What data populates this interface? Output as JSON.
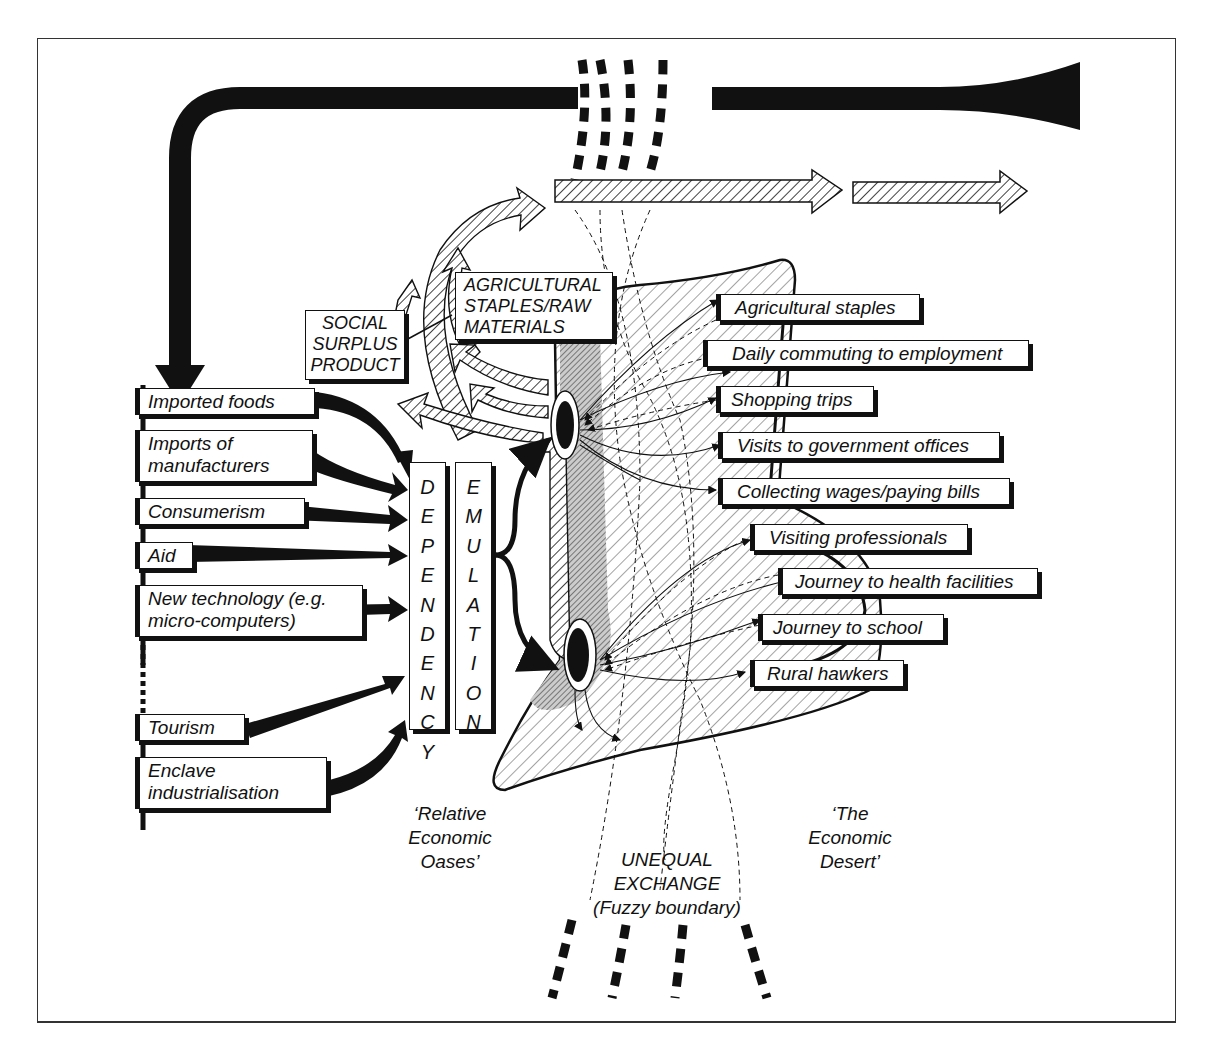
{
  "figure": {
    "colors": {
      "ink": "#111111",
      "background": "#ffffff",
      "shadow": "#111111",
      "frame": "#333333"
    }
  },
  "left_column": {
    "items": [
      {
        "id": "imported-foods",
        "label": "Imported foods"
      },
      {
        "id": "imports-manufacturers",
        "label": "Imports of\nmanufacturers",
        "line1": "Imports of",
        "line2": "manufacturers"
      },
      {
        "id": "consumerism",
        "label": "Consumerism"
      },
      {
        "id": "aid",
        "label": "Aid"
      },
      {
        "id": "new-technology",
        "label": "New technology (e.g. micro-computers)",
        "line1": "New technology (e.g.",
        "line2": "micro-computers)"
      },
      {
        "id": "tourism",
        "label": "Tourism"
      },
      {
        "id": "enclave-industrialisation",
        "label": "Enclave industrialisation",
        "line1": "Enclave",
        "line2": "industrialisation"
      }
    ]
  },
  "vertical_boxes": {
    "dependency": {
      "label": "DEPENDENCY",
      "letters": [
        "D",
        "E",
        "P",
        "E",
        "N",
        "D",
        "E",
        "N",
        "C",
        "Y"
      ]
    },
    "emulation": {
      "label": "EMULATION",
      "letters": [
        "E",
        "M",
        "U",
        "L",
        "A",
        "T",
        "I",
        "O",
        "N"
      ]
    }
  },
  "upper_boxes": {
    "social_surplus": {
      "line1": "SOCIAL",
      "line2": "SURPLUS",
      "line3": "PRODUCT"
    },
    "agri_raw": {
      "line1": "AGRICULTURAL",
      "line2": "STAPLES/RAW",
      "line3": "MATERIALS"
    }
  },
  "right_column": {
    "items": [
      {
        "id": "agricultural-staples",
        "label": "Agricultural staples"
      },
      {
        "id": "daily-commuting",
        "label": "Daily commuting to employment"
      },
      {
        "id": "shopping-trips",
        "label": "Shopping trips"
      },
      {
        "id": "government-offices",
        "label": "Visits to government offices"
      },
      {
        "id": "collecting-wages",
        "label": "Collecting wages/paying bills"
      },
      {
        "id": "visiting-professionals",
        "label": "Visiting professionals"
      },
      {
        "id": "health-facilities",
        "label": "Journey to health facilities"
      },
      {
        "id": "journey-school",
        "label": "Journey to school"
      },
      {
        "id": "rural-hawkers",
        "label": "Rural hawkers"
      }
    ]
  },
  "region_labels": {
    "oases": {
      "line1": "‘Relative",
      "line2": "Economic",
      "line3": "Oases’"
    },
    "desert": {
      "line1": "‘The",
      "line2": "Economic",
      "line3": "Desert’"
    },
    "exchange": {
      "line1": "UNEQUAL",
      "line2": "EXCHANGE",
      "line3": "(Fuzzy boundary)"
    }
  }
}
